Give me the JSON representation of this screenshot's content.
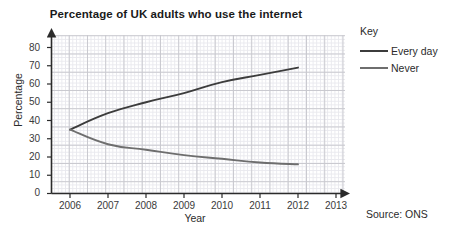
{
  "chart_data": {
    "type": "line",
    "title": "Percentage of UK adults who use the internet",
    "xlabel": "Year",
    "ylabel": "Percentage",
    "xlim": [
      2006,
      2013
    ],
    "ylim": [
      0,
      85
    ],
    "xticks": [
      "2006",
      "2007",
      "2008",
      "2009",
      "2010",
      "2011",
      "2012",
      "2013"
    ],
    "yticks": [
      "0",
      "10",
      "20",
      "30",
      "40",
      "50",
      "60",
      "70",
      "80"
    ],
    "grid": true,
    "grid_minor": true,
    "legend_title": "Key",
    "legend_position": "right",
    "x": [
      2006,
      2007,
      2008,
      2009,
      2010,
      2011,
      2012
    ],
    "series": [
      {
        "name": "Every day",
        "values": [
          35,
          44,
          50,
          55,
          61,
          65,
          69
        ],
        "color": "#3c3c3c"
      },
      {
        "name": "Never",
        "values": [
          35,
          27,
          24,
          21,
          19,
          17,
          16
        ],
        "color": "#6e6e6e"
      }
    ],
    "annotations": [
      {
        "name": "source",
        "text": "Source: ONS"
      }
    ]
  },
  "figure": {
    "title": "Percentage of UK adults who use the internet",
    "axis": {
      "y_label": "Percentage",
      "x_label": "Year"
    },
    "legend": {
      "title": "Key",
      "entries": [
        {
          "label": "Every day",
          "color": "#3c3c3c"
        },
        {
          "label": "Never",
          "color": "#6e6e6e"
        }
      ]
    },
    "source": "Source: ONS",
    "colors": {
      "every_day": "#3c3c3c",
      "never": "#6e6e6e",
      "axis": "#2b2b2b",
      "grid_major": "#c9c9cf",
      "grid_minor": "#e9e9ee"
    }
  }
}
